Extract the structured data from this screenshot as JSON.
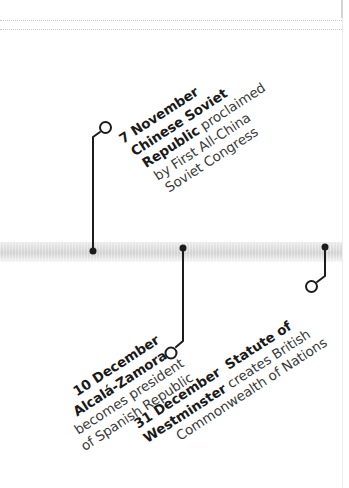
{
  "timeline": {
    "band_color": "#d6d6d6",
    "connector_color": "#1c1c1c",
    "events": [
      {
        "date": "7 November",
        "lines": [
          {
            "bold": "7 November",
            "text": ""
          },
          {
            "bold": "Chinese Soviet",
            "text": ""
          },
          {
            "bold": "Republic",
            "text": " proclaimed"
          },
          {
            "bold": "",
            "text": "by First All-China"
          },
          {
            "bold": "",
            "text": "Soviet Congress"
          }
        ],
        "title": "Chinese Soviet Republic",
        "description": "proclaimed by First All-China Soviet Congress",
        "position": "above"
      },
      {
        "date": "10 December",
        "lines": [
          {
            "bold": "10 December",
            "text": ""
          },
          {
            "bold": "Alcalá-Zamora",
            "text": ""
          },
          {
            "bold": "",
            "text": "becomes president"
          },
          {
            "bold": "",
            "text": "of Spanish Republic"
          }
        ],
        "title": "Alcalá-Zamora",
        "description": "becomes president of Spanish Republic",
        "position": "below"
      },
      {
        "date": "31 December",
        "lines": [
          {
            "bold": "31 December",
            "text": ""
          },
          {
            "bold": " Statute of",
            "text": ""
          },
          {
            "bold": "Westminster",
            "text": " creates British"
          },
          {
            "bold": "",
            "text": "Commonwealth of Nations"
          }
        ],
        "title": "Statute of Westminster",
        "description": "creates British Commonwealth of Nations",
        "position": "below"
      }
    ]
  }
}
